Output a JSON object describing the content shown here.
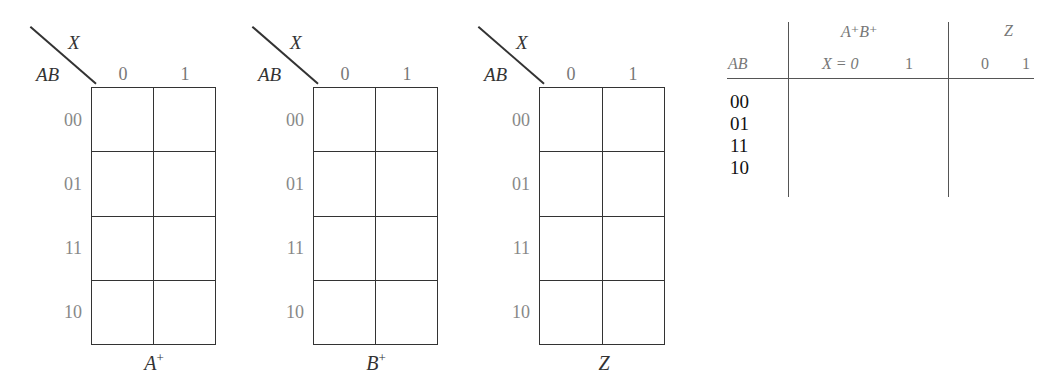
{
  "kmaps": [
    {
      "id": "A-plus",
      "corner_col_var": "X",
      "corner_row_var": "AB",
      "col_labels": [
        "0",
        "1"
      ],
      "row_labels": [
        "00",
        "01",
        "11",
        "10"
      ],
      "title_base": "A",
      "title_sup": "+",
      "cells": [
        [
          "",
          ""
        ],
        [
          "",
          ""
        ],
        [
          "",
          ""
        ],
        [
          "",
          ""
        ]
      ]
    },
    {
      "id": "B-plus",
      "corner_col_var": "X",
      "corner_row_var": "AB",
      "col_labels": [
        "0",
        "1"
      ],
      "row_labels": [
        "00",
        "01",
        "11",
        "10"
      ],
      "title_base": "B",
      "title_sup": "+",
      "cells": [
        [
          "",
          ""
        ],
        [
          "",
          ""
        ],
        [
          "",
          ""
        ],
        [
          "",
          ""
        ]
      ]
    },
    {
      "id": "Z",
      "corner_col_var": "X",
      "corner_row_var": "AB",
      "col_labels": [
        "0",
        "1"
      ],
      "row_labels": [
        "00",
        "01",
        "11",
        "10"
      ],
      "title_base": "Z",
      "title_sup": "",
      "cells": [
        [
          "",
          ""
        ],
        [
          "",
          ""
        ],
        [
          "",
          ""
        ],
        [
          "",
          ""
        ]
      ]
    }
  ],
  "state_table": {
    "header_group_1": "A⁺B⁺",
    "header_group_2": "Z",
    "row_header": "AB",
    "sub_headers_1": [
      "X = 0",
      "1"
    ],
    "sub_headers_2": [
      "0",
      "1"
    ],
    "rows": [
      "00",
      "01",
      "11",
      "10"
    ]
  }
}
